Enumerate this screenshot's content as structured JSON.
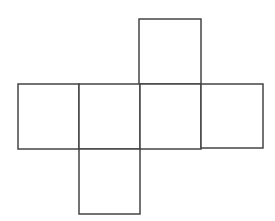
{
  "diagram": {
    "type": "cube-net",
    "stroke": "#444444",
    "fill": "#ffffff",
    "faces": [
      {
        "id": "top",
        "x": 139,
        "y": 19,
        "w": 62,
        "h": 65
      },
      {
        "id": "left",
        "x": 18,
        "y": 84,
        "w": 61,
        "h": 65
      },
      {
        "id": "center-left",
        "x": 79,
        "y": 84,
        "w": 61,
        "h": 65
      },
      {
        "id": "center-right",
        "x": 140,
        "y": 84,
        "w": 61,
        "h": 65
      },
      {
        "id": "right",
        "x": 201,
        "y": 84,
        "w": 62,
        "h": 64
      },
      {
        "id": "bottom",
        "x": 79,
        "y": 149,
        "w": 61,
        "h": 65
      }
    ]
  }
}
